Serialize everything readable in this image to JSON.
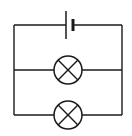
{
  "diagram": {
    "type": "circuit",
    "canvas": {
      "width": 132,
      "height": 136,
      "background": "#ffffff"
    },
    "stroke_color": "#1a1a1a",
    "circuit": {
      "left_x": 14,
      "right_x": 122,
      "top_y": 25,
      "components": [
        {
          "kind": "cell",
          "name": "battery",
          "long_plate_x": 66,
          "short_plate_x": 73,
          "y": 25
        },
        {
          "kind": "lamp",
          "name": "lamp-1",
          "cx": 68,
          "cy": 70,
          "r": 14
        },
        {
          "kind": "lamp",
          "name": "lamp-2",
          "cx": 68,
          "cy": 115,
          "r": 14
        }
      ]
    }
  }
}
